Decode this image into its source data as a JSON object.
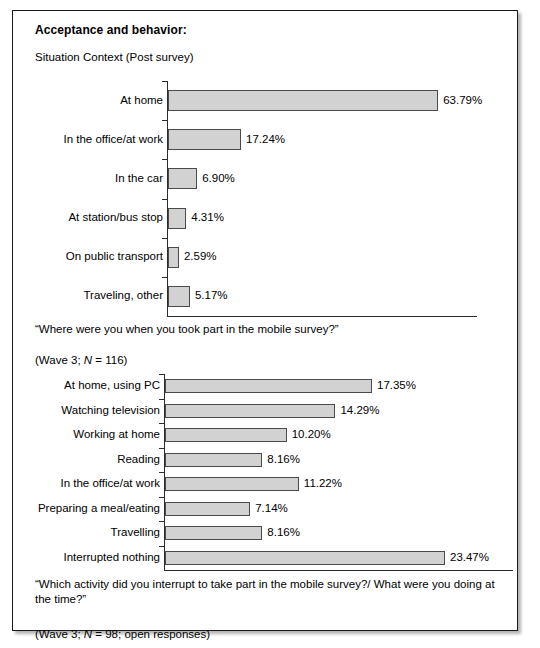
{
  "figure": {
    "title": "Acceptance and behavior:",
    "subtitle": "Situation Context (Post survey)"
  },
  "chart_data": [
    {
      "type": "bar",
      "orientation": "horizontal",
      "title": "Situation Context (Post survey)",
      "categories": [
        "At home",
        "In the office/at work",
        "In the car",
        "At station/bus stop",
        "On public transport",
        "Traveling, other"
      ],
      "values": [
        63.79,
        17.24,
        6.9,
        4.31,
        2.59,
        5.17
      ],
      "data_labels": [
        "63.79%",
        "17.24%",
        "6.90%",
        "4.31%",
        "2.59%",
        "5.17%"
      ],
      "xlabel": "",
      "ylabel": "",
      "xlim": [
        0,
        73
      ],
      "grid": false,
      "legend": "none",
      "caption_line1": "“Where were you when you took part in the mobile survey?”",
      "caption_line2_pre": "(Wave 3; ",
      "caption_line2_it": "N",
      "caption_line2_post": " = 116)"
    },
    {
      "type": "bar",
      "orientation": "horizontal",
      "title": "",
      "categories": [
        "At home, using PC",
        "Watching television",
        "Working at home",
        "Reading",
        "In the office/at work",
        "Preparing a meal/eating",
        "Travelling",
        "Interrupted nothing"
      ],
      "values": [
        17.35,
        14.29,
        10.2,
        8.16,
        11.22,
        7.14,
        8.16,
        23.47
      ],
      "data_labels": [
        "17.35%",
        "14.29%",
        "10.20%",
        "8.16%",
        "11.22%",
        "7.14%",
        "8.16%",
        "23.47%"
      ],
      "xlabel": "",
      "ylabel": "",
      "xlim": [
        0,
        28
      ],
      "grid": false,
      "legend": "none",
      "caption_line1": "“Which activity did you interrupt to take part in the mobile survey?/ What were you doing at\nthe time?”",
      "caption_line2_pre": "(Wave 3; ",
      "caption_line2_it": "N",
      "caption_line2_post": " = 98; open responses)"
    }
  ],
  "colors": {
    "bar_fill": "#d2d2d2",
    "bar_stroke": "#4a4a4a",
    "axis": "#2b2b2b",
    "frame": "#1a1a1a",
    "text": "#000000"
  }
}
